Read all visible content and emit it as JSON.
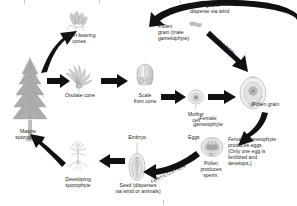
{
  "diagram": {
    "type": "biological-life-cycle-diagram",
    "background_color": "#ffffff",
    "ink_color": "#111111"
  },
  "labels": {
    "pollen_bearing_cones": "Pollen-bearing\ncones",
    "pollen_grains_disperse": "Pollen grains\ndisperse via wind",
    "pollen_grain_male": "Pollen\ngrain (male\ngametophyte)",
    "pollination": "POLLINATION",
    "ovulate_cone": "Ovulate cone",
    "scale_from_cone": "Scale\nfrom cone",
    "mother_cell": "Mother\ncell",
    "pollen_grain": "Pollen grain",
    "female_gametophyte": "Female\ngametophyte",
    "eggs": "Eggs",
    "female_gametophyte_note": "Female gametophyte\nproduces eggs.\n(Only one egg is\nfertilized and\ndevelops.)",
    "pollen_produces_sperm": "Pollen\nproduces\nsperm.",
    "fertilization": "FERTILIZATION",
    "embryo": "Embryo",
    "seed": "Seed (disperses\nvia wind or animals)",
    "developing_sporophyte": "Developing\nsporophyte",
    "mature_sporophyte": "Mature\nsporophyte"
  },
  "icons": {
    "pollen_cones": "pollen-bearing-cones-icon",
    "ovulate_cone": "ovulate-cone-icon",
    "scale": "cone-scale-icon",
    "ovule": "ovule-icon",
    "mother_cell": "mother-cell-icon",
    "pollen_dust": "pollen-grain-cluster-icon",
    "archegonia": "female-gametophyte-icon",
    "seed": "seed-icon",
    "seedling": "developing-sporophyte-icon",
    "tree": "mature-conifer-tree-icon"
  },
  "arrows": [
    {
      "name": "tree-to-pollen-cones"
    },
    {
      "name": "tree-to-ovulate-cone"
    },
    {
      "name": "ovulate-cone-to-scale"
    },
    {
      "name": "scale-to-ovule"
    },
    {
      "name": "pollen-cones-to-dispersal"
    },
    {
      "name": "pollination-arrow"
    },
    {
      "name": "ovule-to-gametophyte"
    },
    {
      "name": "fertilization-arrow"
    },
    {
      "name": "seed-to-seedling"
    },
    {
      "name": "seedling-to-tree"
    }
  ]
}
